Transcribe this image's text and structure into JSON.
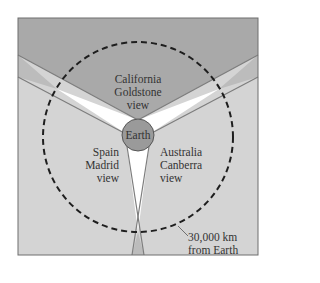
{
  "diagram": {
    "center_label": "Earth",
    "regions": [
      {
        "id": "california",
        "lines": [
          "California",
          "Goldstone",
          "view"
        ]
      },
      {
        "id": "spain",
        "lines": [
          "Spain",
          "Madrid",
          "view"
        ]
      },
      {
        "id": "australia",
        "lines": [
          "Australia",
          "Canberra",
          "view"
        ]
      }
    ],
    "annotation": {
      "lines": [
        "30,000 km",
        "from Earth"
      ]
    },
    "colors": {
      "top_region": "#a9a9a9",
      "side_regions": "#d4d4d4",
      "overlap": "#bcbcbc",
      "gap": "#ffffff",
      "earth": "#9a9a9a",
      "lines": "#7d7d7d",
      "dashed_circle": "#1e1e1e"
    }
  }
}
